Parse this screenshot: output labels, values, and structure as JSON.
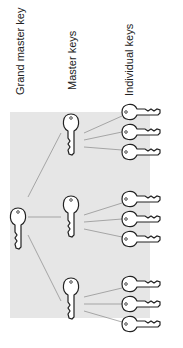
{
  "diagram": {
    "labels": {
      "grand_master": "Grand master key",
      "master": "Master keys",
      "individual": "Individual keys"
    },
    "colors": {
      "panel": "#e6e6e6",
      "line": "#888888",
      "key_stroke": "#222222",
      "text": "#222222"
    },
    "nodes": {
      "grand_master": {
        "x": 18,
        "y": 205
      },
      "masters": [
        {
          "x": 71,
          "y": 123
        },
        {
          "x": 71,
          "y": 205
        },
        {
          "x": 71,
          "y": 287
        }
      ],
      "individual_groups": [
        [
          {
            "x": 130,
            "y": 112
          },
          {
            "x": 130,
            "y": 132
          },
          {
            "x": 130,
            "y": 152
          }
        ],
        [
          {
            "x": 130,
            "y": 199
          },
          {
            "x": 130,
            "y": 219
          },
          {
            "x": 130,
            "y": 239
          }
        ],
        [
          {
            "x": 130,
            "y": 284
          },
          {
            "x": 130,
            "y": 304
          },
          {
            "x": 130,
            "y": 324
          }
        ]
      ]
    }
  }
}
